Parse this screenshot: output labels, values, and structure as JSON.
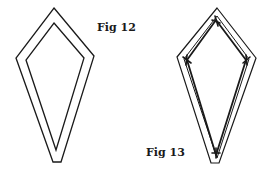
{
  "figures": [
    {
      "label": "Fig 12",
      "description": "Kite shape with outer and inner outline (seam allowance)",
      "outer_points": "54,8 94,56 61,162 53,162 16,58",
      "inner_points": "54,23 84,58 56,150 26,60"
    },
    {
      "label": "Fig 13",
      "description": "Kite shape with outer outline and stitched inner line with corner tick marks",
      "outer_points": "217,8 256,58 219,163 211,163 177,57",
      "inner_points": "217,16 249,59 217,158 184,59",
      "stitch_points": "216,20 246,60 216,155 187,60"
    }
  ],
  "colors": {
    "line": "#1a1a1a",
    "background": "#ffffff"
  }
}
